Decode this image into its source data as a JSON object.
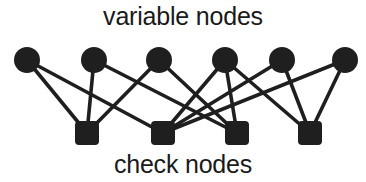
{
  "figure": {
    "type": "tanner-graph",
    "title_top": "variable nodes",
    "title_bottom": "check nodes",
    "width": 366,
    "height": 182,
    "background_color": "#ffffff",
    "ink_color": "#1f1f1f",
    "label_color": "#1a1a1a"
  },
  "labels": {
    "top": "variable nodes",
    "bottom": "check nodes"
  },
  "chart_data": {
    "type": "diagram",
    "graph_kind": "bipartite",
    "variable_node_count": 6,
    "check_node_count": 4,
    "edge_count": 13,
    "variable_nodes": [
      {
        "id": "v1",
        "cx": 27,
        "cy": 60,
        "r": 13,
        "shape": "circle",
        "color": "#1f1f1f"
      },
      {
        "id": "v2",
        "cx": 94,
        "cy": 60,
        "r": 13,
        "shape": "circle",
        "color": "#1f1f1f"
      },
      {
        "id": "v3",
        "cx": 159,
        "cy": 60,
        "r": 13,
        "shape": "circle",
        "color": "#1f1f1f"
      },
      {
        "id": "v4",
        "cx": 225,
        "cy": 60,
        "r": 13,
        "shape": "circle",
        "color": "#1f1f1f"
      },
      {
        "id": "v5",
        "cx": 282,
        "cy": 60,
        "r": 13,
        "shape": "circle",
        "color": "#1f1f1f"
      },
      {
        "id": "v6",
        "cx": 345,
        "cy": 60,
        "r": 13,
        "shape": "circle",
        "color": "#1f1f1f"
      }
    ],
    "check_nodes": [
      {
        "id": "c1",
        "cx": 87,
        "cy": 133,
        "size": 24,
        "shape": "rounded-square",
        "color": "#1f1f1f"
      },
      {
        "id": "c2",
        "cx": 163,
        "cy": 133,
        "size": 24,
        "shape": "rounded-square",
        "color": "#1f1f1f"
      },
      {
        "id": "c3",
        "cx": 237,
        "cy": 133,
        "size": 24,
        "shape": "rounded-square",
        "color": "#1f1f1f"
      },
      {
        "id": "c4",
        "cx": 310,
        "cy": 133,
        "size": 24,
        "shape": "rounded-square",
        "color": "#1f1f1f"
      }
    ],
    "edges": [
      {
        "from": "v1",
        "to": "c1"
      },
      {
        "from": "v1",
        "to": "c2"
      },
      {
        "from": "v2",
        "to": "c1"
      },
      {
        "from": "v2",
        "to": "c3"
      },
      {
        "from": "v3",
        "to": "c1"
      },
      {
        "from": "v3",
        "to": "c3"
      },
      {
        "from": "v4",
        "to": "c2"
      },
      {
        "from": "v4",
        "to": "c3"
      },
      {
        "from": "v4",
        "to": "c4"
      },
      {
        "from": "v5",
        "to": "c2"
      },
      {
        "from": "v5",
        "to": "c4"
      },
      {
        "from": "v6",
        "to": "c2"
      },
      {
        "from": "v6",
        "to": "c4"
      }
    ],
    "edge_style": {
      "stroke": "#1f1f1f",
      "stroke_width": 3.6,
      "linecap": "round"
    }
  }
}
